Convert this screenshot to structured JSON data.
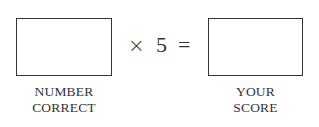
{
  "formula": {
    "left_box": {
      "value": "",
      "label_lines": [
        "NUMBER",
        "CORRECT"
      ]
    },
    "operator": "×",
    "multiplier": "5",
    "equals": "=",
    "right_box": {
      "value": "",
      "label_lines": [
        "YOUR",
        "SCORE"
      ]
    }
  }
}
